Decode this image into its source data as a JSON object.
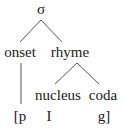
{
  "diagram": {
    "type": "syllable-structure-tree",
    "root": {
      "label": "σ"
    },
    "nodes": {
      "onset": {
        "label": "onset"
      },
      "rhyme": {
        "label": "rhyme"
      },
      "nucleus": {
        "label": "nucleus"
      },
      "coda": {
        "label": "coda"
      }
    },
    "segments": {
      "onset": "[p",
      "nucleus": "I",
      "coda": "g]"
    },
    "edges": [
      {
        "from": "σ",
        "to": "onset"
      },
      {
        "from": "σ",
        "to": "rhyme"
      },
      {
        "from": "rhyme",
        "to": "nucleus"
      },
      {
        "from": "rhyme",
        "to": "coda"
      },
      {
        "from": "onset",
        "to": "[p"
      }
    ],
    "colors": {
      "text": "#1a1a1a",
      "edge": "#555555",
      "background": "#ffffff"
    }
  }
}
